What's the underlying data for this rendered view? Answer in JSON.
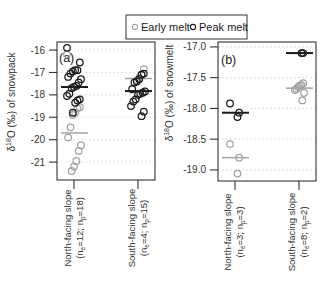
{
  "legend": {
    "early_label": "Early melt",
    "peak_label": "Peak melt",
    "early_color": "#a3a3a3",
    "peak_color": "#1a1a1a"
  },
  "panels": {
    "a": {
      "tag": "(a)",
      "ylabel_delta": "δ",
      "ylabel_sup": "18",
      "ylabel_rest": "O (‰) of snowpack",
      "cat0_line1": "North-facing slope",
      "cat0_line2": [
        "(n",
        "e",
        "=12; n",
        "p",
        "=18)"
      ],
      "cat1_line1": "South-facing slope",
      "cat1_line2": [
        "(n",
        "e",
        "=4; n",
        "p",
        "=15)"
      ]
    },
    "b": {
      "tag": "(b)",
      "ylabel_delta": "δ",
      "ylabel_sup": "18",
      "ylabel_rest": "O (‰) of snowmelt",
      "cat0_line1": "North-facing slope",
      "cat0_line2": [
        "(n",
        "e",
        "=3; n",
        "p",
        "=3)"
      ],
      "cat1_line1": "South-facing slope",
      "cat1_line2": [
        "(n",
        "e",
        "=8; n",
        "p",
        "=2)"
      ]
    }
  },
  "chart_data": [
    {
      "panel": "a",
      "type": "scatter",
      "title": "",
      "ylabel": "δ18O (‰) of snowpack",
      "xlabel": "",
      "ylim": [
        -21.8,
        -15.64
      ],
      "yticks": [
        -16,
        -17,
        -18,
        -19,
        -20,
        -21
      ],
      "ytick_labels": [
        "-16",
        "-17",
        "-18",
        "-19",
        "-20",
        "-21"
      ],
      "grid": true,
      "legend": [
        "Early melt",
        "Peak melt"
      ],
      "legend_position": "top",
      "categories": [
        {
          "name": "North-facing slope",
          "n_e": 12,
          "n_p": 18,
          "early": [
            -16.2,
            -18.55,
            -18.6,
            -18.8,
            -18.9,
            -19.45,
            -19.9,
            -20.25,
            -20.5,
            -20.95,
            -21.2,
            -21.4
          ],
          "peak": [
            -15.9,
            -16.55,
            -16.9,
            -16.9,
            -16.95,
            -17.05,
            -17.2,
            -17.3,
            -17.45,
            -17.6,
            -17.65,
            -17.7,
            -17.95,
            -18.05,
            -18.2,
            -18.25,
            -18.35,
            -18.8
          ],
          "early_median": -19.7,
          "peak_median": -17.65
        },
        {
          "name": "South-facing slope",
          "n_e": 4,
          "n_p": 15,
          "early": [
            -16.85,
            -17.1,
            -17.25,
            -17.35
          ],
          "peak": [
            -17.05,
            -17.1,
            -17.3,
            -17.4,
            -17.45,
            -17.75,
            -17.85,
            -17.9,
            -17.95,
            -18.0,
            -18.2,
            -18.3,
            -18.5,
            -18.75,
            -18.95
          ],
          "early_median": -17.27,
          "peak_median": -17.83
        }
      ]
    },
    {
      "panel": "b",
      "type": "scatter",
      "title": "",
      "ylabel": "δ18O (‰) of snowmelt",
      "xlabel": "",
      "ylim": [
        -19.18,
        -16.92
      ],
      "yticks": [
        -17.0,
        -17.5,
        -18.0,
        -18.5,
        -19.0
      ],
      "ytick_labels": [
        "-17.0",
        "-17.5",
        "-18.0",
        "-18.5",
        "-19.0"
      ],
      "grid": true,
      "legend": [
        "Early melt",
        "Peak melt"
      ],
      "legend_position": "top",
      "categories": [
        {
          "name": "North-facing slope",
          "n_e": 3,
          "n_p": 3,
          "early": [
            -18.58,
            -18.8,
            -19.06
          ],
          "peak": [
            -17.92,
            -18.07,
            -18.14
          ],
          "early_median": -18.8,
          "peak_median": -18.07
        },
        {
          "name": "South-facing slope",
          "n_e": 8,
          "n_p": 2,
          "early": [
            -17.59,
            -17.62,
            -17.63,
            -17.65,
            -17.68,
            -17.7,
            -17.75,
            -17.87
          ],
          "peak": [
            -17.1,
            -17.1
          ],
          "early_median": -17.67,
          "peak_median": -17.1
        }
      ]
    }
  ]
}
